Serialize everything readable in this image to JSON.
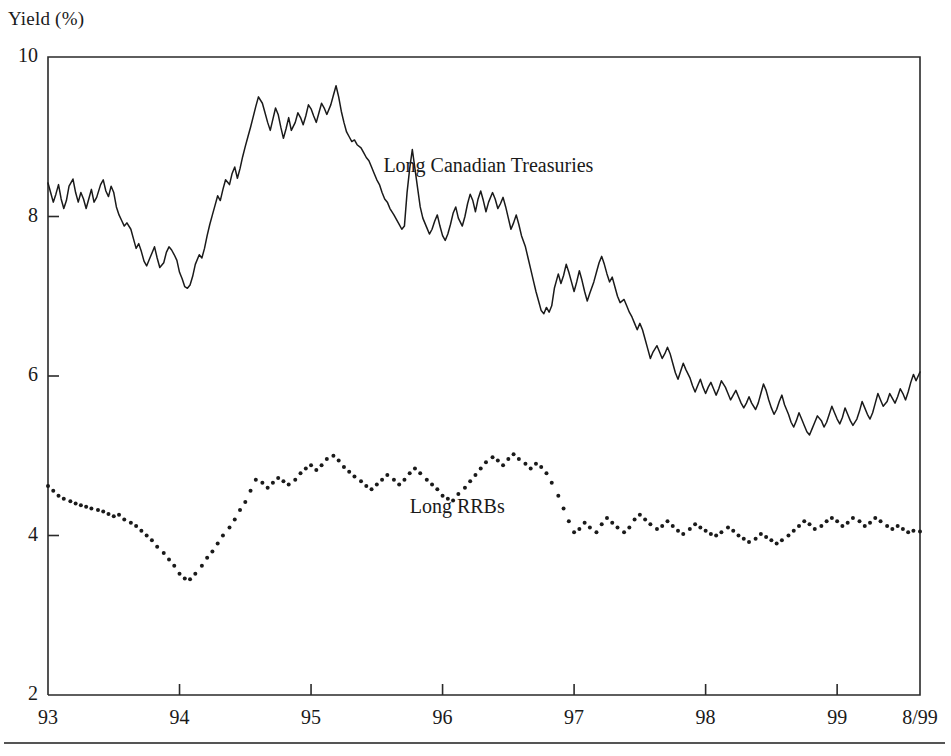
{
  "axis_title": "Yield (%)",
  "y_ticks": [
    {
      "label": "10",
      "value": 10
    },
    {
      "label": "8",
      "value": 8
    },
    {
      "label": "6",
      "value": 6
    },
    {
      "label": "4",
      "value": 4
    },
    {
      "label": "2",
      "value": 2
    }
  ],
  "x_ticks": [
    {
      "label": "93",
      "value": 1993.0
    },
    {
      "label": "94",
      "value": 1994.0
    },
    {
      "label": "95",
      "value": 1995.0
    },
    {
      "label": "96",
      "value": 1996.0
    },
    {
      "label": "97",
      "value": 1997.0
    },
    {
      "label": "98",
      "value": 1998.0
    },
    {
      "label": "99",
      "value": 1999.0
    },
    {
      "label": "8/99",
      "value": 1999.63
    }
  ],
  "series_labels": {
    "treasuries": "Long Canadian Treasuries",
    "rrbs": "Long RRBs"
  },
  "colors": {
    "line": "#1a1a1a",
    "frame": "#2a2a2a",
    "background": "#ffffff",
    "rule": "#555555"
  },
  "chart_data": {
    "type": "line",
    "title": "",
    "subtitle": "",
    "xlabel": "",
    "ylabel": "Yield (%)",
    "xlim": [
      1993.0,
      1999.63
    ],
    "ylim": [
      2,
      10
    ],
    "grid": false,
    "legend": "inline-annotation",
    "annotations": [
      {
        "text": "Long Canadian Treasuries",
        "x": 1995.55,
        "y": 8.62
      },
      {
        "text": "Long RRBs",
        "x": 1995.75,
        "y": 4.35
      }
    ],
    "series": [
      {
        "name": "Long Canadian Treasuries",
        "style": "solid-line",
        "color": "#1a1a1a",
        "x": [
          1993.0,
          1993.02,
          1993.04,
          1993.06,
          1993.08,
          1993.1,
          1993.12,
          1993.14,
          1993.16,
          1993.19,
          1993.21,
          1993.23,
          1993.25,
          1993.27,
          1993.29,
          1993.31,
          1993.33,
          1993.35,
          1993.37,
          1993.4,
          1993.42,
          1993.44,
          1993.46,
          1993.48,
          1993.5,
          1993.52,
          1993.54,
          1993.56,
          1993.58,
          1993.6,
          1993.63,
          1993.65,
          1993.67,
          1993.69,
          1993.71,
          1993.73,
          1993.75,
          1993.77,
          1993.79,
          1993.81,
          1993.83,
          1993.85,
          1993.88,
          1993.9,
          1993.92,
          1993.94,
          1993.96,
          1993.98,
          1994.0,
          1994.02,
          1994.04,
          1994.06,
          1994.08,
          1994.1,
          1994.12,
          1994.15,
          1994.17,
          1994.19,
          1994.21,
          1994.23,
          1994.25,
          1994.27,
          1994.29,
          1994.31,
          1994.33,
          1994.35,
          1994.38,
          1994.4,
          1994.42,
          1994.44,
          1994.46,
          1994.48,
          1994.5,
          1994.52,
          1994.54,
          1994.56,
          1994.58,
          1994.6,
          1994.63,
          1994.65,
          1994.67,
          1994.69,
          1994.71,
          1994.73,
          1994.75,
          1994.77,
          1994.79,
          1994.81,
          1994.83,
          1994.85,
          1994.88,
          1994.9,
          1994.92,
          1994.94,
          1994.96,
          1994.98,
          1995.0,
          1995.02,
          1995.04,
          1995.06,
          1995.08,
          1995.1,
          1995.12,
          1995.15,
          1995.17,
          1995.19,
          1995.21,
          1995.23,
          1995.25,
          1995.27,
          1995.29,
          1995.31,
          1995.33,
          1995.35,
          1995.38,
          1995.4,
          1995.42,
          1995.44,
          1995.46,
          1995.48,
          1995.5,
          1995.52,
          1995.54,
          1995.56,
          1995.58,
          1995.6,
          1995.63,
          1995.65,
          1995.67,
          1995.69,
          1995.71,
          1995.73,
          1995.75,
          1995.77,
          1995.79,
          1995.81,
          1995.83,
          1995.85,
          1995.88,
          1995.9,
          1995.92,
          1995.94,
          1995.96,
          1995.98,
          1996.0,
          1996.02,
          1996.04,
          1996.06,
          1996.08,
          1996.1,
          1996.12,
          1996.15,
          1996.17,
          1996.19,
          1996.21,
          1996.23,
          1996.25,
          1996.27,
          1996.29,
          1996.31,
          1996.33,
          1996.35,
          1996.38,
          1996.4,
          1996.42,
          1996.44,
          1996.46,
          1996.48,
          1996.5,
          1996.52,
          1996.54,
          1996.56,
          1996.58,
          1996.6,
          1996.63,
          1996.65,
          1996.67,
          1996.69,
          1996.71,
          1996.73,
          1996.75,
          1996.77,
          1996.79,
          1996.81,
          1996.83,
          1996.85,
          1996.88,
          1996.9,
          1996.92,
          1996.94,
          1996.96,
          1996.98,
          1997.0,
          1997.02,
          1997.04,
          1997.06,
          1997.08,
          1997.1,
          1997.12,
          1997.15,
          1997.17,
          1997.19,
          1997.21,
          1997.23,
          1997.25,
          1997.27,
          1997.29,
          1997.31,
          1997.33,
          1997.35,
          1997.38,
          1997.4,
          1997.42,
          1997.44,
          1997.46,
          1997.48,
          1997.5,
          1997.52,
          1997.54,
          1997.56,
          1997.58,
          1997.6,
          1997.63,
          1997.65,
          1997.67,
          1997.69,
          1997.71,
          1997.73,
          1997.75,
          1997.77,
          1997.79,
          1997.81,
          1997.83,
          1997.85,
          1997.88,
          1997.9,
          1997.92,
          1997.94,
          1997.96,
          1997.98,
          1998.0,
          1998.02,
          1998.04,
          1998.06,
          1998.08,
          1998.1,
          1998.12,
          1998.15,
          1998.17,
          1998.19,
          1998.21,
          1998.23,
          1998.25,
          1998.27,
          1998.29,
          1998.31,
          1998.33,
          1998.35,
          1998.38,
          1998.4,
          1998.42,
          1998.44,
          1998.46,
          1998.48,
          1998.5,
          1998.52,
          1998.54,
          1998.56,
          1998.58,
          1998.6,
          1998.63,
          1998.65,
          1998.67,
          1998.69,
          1998.71,
          1998.73,
          1998.75,
          1998.77,
          1998.79,
          1998.81,
          1998.83,
          1998.85,
          1998.88,
          1998.9,
          1998.92,
          1998.94,
          1998.96,
          1998.98,
          1999.0,
          1999.02,
          1999.04,
          1999.06,
          1999.08,
          1999.1,
          1999.12,
          1999.15,
          1999.17,
          1999.19,
          1999.21,
          1999.23,
          1999.25,
          1999.27,
          1999.29,
          1999.31,
          1999.33,
          1999.35,
          1999.38,
          1999.4,
          1999.42,
          1999.44,
          1999.46,
          1999.48,
          1999.5,
          1999.52,
          1999.54,
          1999.56,
          1999.58,
          1999.6,
          1999.63
        ],
        "y": [
          8.42,
          8.3,
          8.18,
          8.28,
          8.4,
          8.22,
          8.1,
          8.2,
          8.38,
          8.47,
          8.3,
          8.18,
          8.3,
          8.22,
          8.1,
          8.22,
          8.34,
          8.18,
          8.24,
          8.4,
          8.46,
          8.32,
          8.25,
          8.38,
          8.3,
          8.12,
          8.02,
          7.95,
          7.88,
          7.92,
          7.84,
          7.72,
          7.6,
          7.66,
          7.56,
          7.44,
          7.38,
          7.46,
          7.54,
          7.62,
          7.48,
          7.36,
          7.42,
          7.55,
          7.62,
          7.58,
          7.52,
          7.45,
          7.3,
          7.22,
          7.12,
          7.1,
          7.14,
          7.25,
          7.4,
          7.52,
          7.48,
          7.6,
          7.76,
          7.9,
          8.02,
          8.14,
          8.26,
          8.2,
          8.34,
          8.46,
          8.4,
          8.54,
          8.62,
          8.48,
          8.6,
          8.75,
          8.88,
          9.0,
          9.12,
          9.25,
          9.38,
          9.5,
          9.42,
          9.3,
          9.18,
          9.08,
          9.22,
          9.36,
          9.28,
          9.12,
          8.98,
          9.1,
          9.24,
          9.08,
          9.18,
          9.3,
          9.24,
          9.15,
          9.26,
          9.4,
          9.35,
          9.26,
          9.18,
          9.3,
          9.42,
          9.36,
          9.28,
          9.4,
          9.52,
          9.64,
          9.5,
          9.32,
          9.18,
          9.06,
          9.0,
          8.94,
          8.96,
          8.9,
          8.86,
          8.8,
          8.74,
          8.7,
          8.62,
          8.54,
          8.46,
          8.4,
          8.3,
          8.22,
          8.18,
          8.1,
          8.02,
          7.96,
          7.9,
          7.84,
          7.88,
          8.3,
          8.6,
          8.84,
          8.6,
          8.36,
          8.12,
          7.98,
          7.86,
          7.78,
          7.84,
          7.94,
          8.02,
          7.88,
          7.76,
          7.7,
          7.78,
          7.9,
          8.04,
          8.12,
          7.98,
          7.88,
          8.0,
          8.16,
          8.28,
          8.2,
          8.06,
          8.22,
          8.32,
          8.2,
          8.06,
          8.18,
          8.3,
          8.22,
          8.1,
          8.16,
          8.24,
          8.12,
          7.98,
          7.84,
          7.92,
          8.02,
          7.9,
          7.76,
          7.62,
          7.48,
          7.34,
          7.2,
          7.06,
          6.94,
          6.82,
          6.78,
          6.86,
          6.8,
          6.88,
          7.1,
          7.28,
          7.16,
          7.26,
          7.4,
          7.3,
          7.18,
          7.06,
          7.18,
          7.32,
          7.2,
          7.06,
          6.94,
          7.04,
          7.18,
          7.3,
          7.42,
          7.5,
          7.4,
          7.28,
          7.18,
          7.24,
          7.12,
          7.0,
          6.92,
          6.96,
          6.88,
          6.8,
          6.74,
          6.66,
          6.58,
          6.66,
          6.58,
          6.46,
          6.34,
          6.22,
          6.3,
          6.38,
          6.3,
          6.22,
          6.28,
          6.36,
          6.28,
          6.16,
          6.04,
          5.96,
          6.06,
          6.16,
          6.08,
          5.98,
          5.88,
          5.8,
          5.88,
          5.96,
          5.86,
          5.78,
          5.86,
          5.92,
          5.84,
          5.76,
          5.84,
          5.94,
          5.86,
          5.78,
          5.7,
          5.76,
          5.82,
          5.74,
          5.66,
          5.6,
          5.66,
          5.74,
          5.66,
          5.58,
          5.66,
          5.78,
          5.9,
          5.82,
          5.7,
          5.6,
          5.52,
          5.58,
          5.68,
          5.76,
          5.64,
          5.52,
          5.42,
          5.36,
          5.44,
          5.54,
          5.46,
          5.38,
          5.3,
          5.26,
          5.34,
          5.42,
          5.5,
          5.44,
          5.36,
          5.42,
          5.52,
          5.62,
          5.54,
          5.46,
          5.4,
          5.48,
          5.6,
          5.52,
          5.44,
          5.38,
          5.46,
          5.56,
          5.68,
          5.6,
          5.52,
          5.46,
          5.54,
          5.66,
          5.78,
          5.7,
          5.62,
          5.68,
          5.78,
          5.72,
          5.66,
          5.74,
          5.84,
          5.78,
          5.7,
          5.8,
          5.92,
          6.02,
          5.94,
          6.05
        ]
      },
      {
        "name": "Long RRBs",
        "style": "dotted-markers",
        "color": "#1a1a1a",
        "x": [
          1993.0,
          1993.04,
          1993.08,
          1993.12,
          1993.17,
          1993.21,
          1993.25,
          1993.29,
          1993.33,
          1993.38,
          1993.42,
          1993.46,
          1993.5,
          1993.54,
          1993.58,
          1993.63,
          1993.67,
          1993.71,
          1993.75,
          1993.79,
          1993.83,
          1993.88,
          1993.92,
          1993.96,
          1994.0,
          1994.04,
          1994.08,
          1994.12,
          1994.17,
          1994.21,
          1994.25,
          1994.29,
          1994.33,
          1994.38,
          1994.42,
          1994.46,
          1994.5,
          1994.54,
          1994.58,
          1994.63,
          1994.67,
          1994.71,
          1994.75,
          1994.79,
          1994.83,
          1994.88,
          1994.92,
          1994.96,
          1995.0,
          1995.04,
          1995.08,
          1995.12,
          1995.17,
          1995.21,
          1995.25,
          1995.29,
          1995.33,
          1995.38,
          1995.42,
          1995.46,
          1995.5,
          1995.54,
          1995.58,
          1995.63,
          1995.67,
          1995.71,
          1995.75,
          1995.79,
          1995.83,
          1995.88,
          1995.92,
          1995.96,
          1996.0,
          1996.04,
          1996.08,
          1996.12,
          1996.17,
          1996.21,
          1996.25,
          1996.29,
          1996.33,
          1996.38,
          1996.42,
          1996.46,
          1996.5,
          1996.54,
          1996.58,
          1996.63,
          1996.67,
          1996.71,
          1996.75,
          1996.79,
          1996.83,
          1996.88,
          1996.92,
          1996.96,
          1997.0,
          1997.04,
          1997.08,
          1997.12,
          1997.17,
          1997.21,
          1997.25,
          1997.29,
          1997.33,
          1997.38,
          1997.42,
          1997.46,
          1997.5,
          1997.54,
          1997.58,
          1997.63,
          1997.67,
          1997.71,
          1997.75,
          1997.79,
          1997.83,
          1997.88,
          1997.92,
          1997.96,
          1998.0,
          1998.04,
          1998.08,
          1998.12,
          1998.17,
          1998.21,
          1998.25,
          1998.29,
          1998.33,
          1998.38,
          1998.42,
          1998.46,
          1998.5,
          1998.54,
          1998.58,
          1998.63,
          1998.67,
          1998.71,
          1998.75,
          1998.79,
          1998.83,
          1998.88,
          1998.92,
          1998.96,
          1999.0,
          1999.04,
          1999.08,
          1999.12,
          1999.17,
          1999.21,
          1999.25,
          1999.29,
          1999.33,
          1999.38,
          1999.42,
          1999.46,
          1999.5,
          1999.54,
          1999.58,
          1999.63
        ],
        "y": [
          4.62,
          4.56,
          4.5,
          4.46,
          4.43,
          4.4,
          4.38,
          4.36,
          4.34,
          4.32,
          4.3,
          4.27,
          4.24,
          4.26,
          4.2,
          4.16,
          4.12,
          4.06,
          4.0,
          3.94,
          3.86,
          3.78,
          3.7,
          3.62,
          3.52,
          3.46,
          3.45,
          3.52,
          3.62,
          3.72,
          3.8,
          3.9,
          4.0,
          4.1,
          4.2,
          4.32,
          4.42,
          4.56,
          4.7,
          4.66,
          4.6,
          4.66,
          4.72,
          4.68,
          4.64,
          4.7,
          4.78,
          4.84,
          4.88,
          4.82,
          4.88,
          4.96,
          5.0,
          4.94,
          4.86,
          4.8,
          4.74,
          4.68,
          4.62,
          4.58,
          4.64,
          4.7,
          4.76,
          4.7,
          4.64,
          4.7,
          4.78,
          4.84,
          4.78,
          4.7,
          4.64,
          4.58,
          4.5,
          4.46,
          4.44,
          4.52,
          4.6,
          4.68,
          4.76,
          4.84,
          4.92,
          4.98,
          4.94,
          4.88,
          4.96,
          5.02,
          4.96,
          4.9,
          4.84,
          4.9,
          4.86,
          4.78,
          4.66,
          4.5,
          4.34,
          4.18,
          4.04,
          4.08,
          4.16,
          4.1,
          4.04,
          4.14,
          4.22,
          4.16,
          4.1,
          4.04,
          4.1,
          4.2,
          4.26,
          4.2,
          4.14,
          4.08,
          4.12,
          4.18,
          4.12,
          4.06,
          4.02,
          4.08,
          4.14,
          4.1,
          4.06,
          4.02,
          4.0,
          4.04,
          4.1,
          4.06,
          4.0,
          3.96,
          3.92,
          3.96,
          4.02,
          3.98,
          3.94,
          3.9,
          3.94,
          4.0,
          4.06,
          4.12,
          4.18,
          4.14,
          4.08,
          4.12,
          4.18,
          4.22,
          4.18,
          4.12,
          4.16,
          4.22,
          4.18,
          4.12,
          4.16,
          4.22,
          4.18,
          4.12,
          4.08,
          4.12,
          4.08,
          4.04,
          4.06,
          4.05
        ]
      }
    ]
  }
}
